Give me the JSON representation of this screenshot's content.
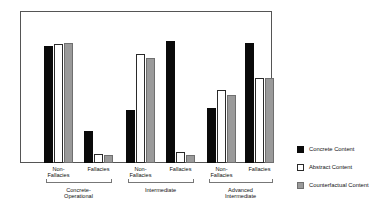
{
  "chart_data": {
    "type": "bar",
    "title": "",
    "subtitle": "",
    "xlabel": "",
    "ylabel": "",
    "grid": false,
    "ylim": [
      0,
      100
    ],
    "legend_position": "right",
    "axis_frame": true,
    "y_axis_ticks_visible": false,
    "categories": [
      "Non-Fallacies",
      "Fallacies",
      "Non-Fallacies",
      "Fallacies",
      "Non-Fallacies",
      "Fallacies"
    ],
    "groups": [
      {
        "label": "Concrete-Operational",
        "label_lines": [
          "Concrete-",
          "Operational"
        ],
        "categories": [
          "Non-Fallacies",
          "Fallacies"
        ]
      },
      {
        "label": "Intermediate",
        "label_lines": [
          "Intermediate"
        ],
        "categories": [
          "Non-Fallacies",
          "Fallacies"
        ]
      },
      {
        "label": "Advanced Intermediate",
        "label_lines": [
          "Advanced",
          "Intermediate"
        ],
        "categories": [
          "Non-Fallacies",
          "Fallacies"
        ]
      }
    ],
    "series": [
      {
        "name": "Concrete Content",
        "color": "#0a0a0a",
        "values": [
          77,
          21,
          35,
          80,
          36,
          79
        ]
      },
      {
        "name": "Abstract Content",
        "color": "#ffffff",
        "values": [
          78,
          6,
          72,
          7,
          48,
          56
        ]
      },
      {
        "name": "Counterfactual Content",
        "color": "#9a9a9a",
        "values": [
          79,
          5,
          69,
          5,
          45,
          56
        ]
      }
    ]
  },
  "category_labels": [
    {
      "lines": [
        "Non-",
        "Fallacies"
      ]
    },
    {
      "lines": [
        "Fallacies"
      ]
    },
    {
      "lines": [
        "Non-",
        "Fallacies"
      ]
    },
    {
      "lines": [
        "Fallacies"
      ]
    },
    {
      "lines": [
        "Non-",
        "Fallacies"
      ]
    },
    {
      "lines": [
        "Fallacies"
      ]
    }
  ],
  "legend": {
    "items": [
      {
        "label": "Concrete Content",
        "swatch": "filled-black-square",
        "color": "#0a0a0a"
      },
      {
        "label": "Abstract Content",
        "swatch": "outlined-white-square",
        "color": "#ffffff"
      },
      {
        "label": "Counterfactual Content",
        "swatch": "filled-gray-square",
        "color": "#9a9a9a"
      }
    ]
  },
  "colors": {
    "concrete": "#0a0a0a",
    "abstract": "#ffffff",
    "counterfactual": "#9a9a9a",
    "frame": "#555555",
    "bracket": "#777777",
    "text": "#111111",
    "background": "#ffffff"
  }
}
